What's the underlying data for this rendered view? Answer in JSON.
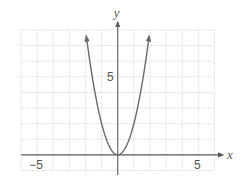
{
  "chart_data": {
    "type": "line",
    "title": "",
    "xlabel": "x",
    "ylabel": "y",
    "xlim": [
      -6,
      6
    ],
    "ylim": [
      -1,
      8
    ],
    "grid": true,
    "grid_step": 1,
    "x_tick_labels": [
      {
        "value": -5,
        "label": "−5"
      },
      {
        "value": 5,
        "label": "5"
      }
    ],
    "y_tick_labels": [
      {
        "value": 5,
        "label": "5"
      }
    ],
    "series": [
      {
        "name": "y = 2x²",
        "equation": "y = 2x^2",
        "x_range": [
          -1.95,
          1.95
        ],
        "arrows_at_ends": true,
        "x": [
          -1.95,
          -1.5,
          -1,
          -0.5,
          0,
          0.5,
          1,
          1.5,
          1.95
        ],
        "y": [
          7.6,
          4.5,
          2,
          0.5,
          0,
          0.5,
          2,
          4.5,
          7.6
        ]
      }
    ],
    "legend": null
  },
  "colors": {
    "grid": "#c9c9c9",
    "axis": "#5a5a5a",
    "curve": "#6a6a6a",
    "text": "#555555"
  }
}
